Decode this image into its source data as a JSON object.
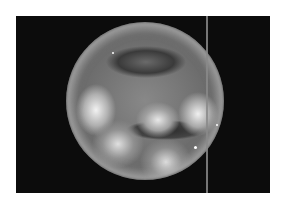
{
  "image": {
    "description": "Grayscale circular endoscopic view on black background with a vertical line at right",
    "colors": {
      "background": "#ffffff",
      "frame": "#0c0c0c",
      "line": "#8a8a8a"
    }
  }
}
